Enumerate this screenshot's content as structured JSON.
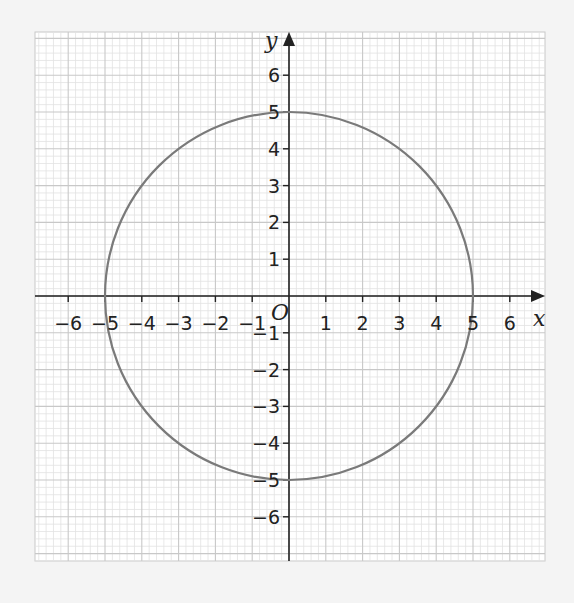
{
  "chart_data": {
    "type": "line",
    "title": "",
    "xlabel": "x",
    "ylabel": "y",
    "origin_label": "O",
    "xlim": [
      -6.9,
      6.95
    ],
    "ylim": [
      -7.2,
      7.2
    ],
    "x_ticks": [
      -6,
      -5,
      -4,
      -3,
      -2,
      -1,
      1,
      2,
      3,
      4,
      5,
      6
    ],
    "y_ticks": [
      -6,
      -5,
      -4,
      -3,
      -2,
      -1,
      1,
      2,
      3,
      4,
      5,
      6
    ],
    "x_tick_labels": [
      "−6",
      "−5",
      "−4",
      "−3",
      "−2",
      "−1",
      "1",
      "2",
      "3",
      "4",
      "5",
      "6"
    ],
    "y_tick_labels": [
      "−6",
      "−5",
      "−4",
      "−3",
      "−2",
      "−1",
      "1",
      "2",
      "3",
      "4",
      "5",
      "6"
    ],
    "grid": {
      "major": 1,
      "minor": 0.2,
      "on": true
    },
    "series": [
      {
        "name": "circle x^2 + y^2 = 25",
        "shape": "circle",
        "center": [
          0,
          0
        ],
        "radius": 5,
        "color": "#7a7a7a"
      }
    ],
    "colors": {
      "background": "#f4f4f4",
      "paper": "#ffffff",
      "minor_grid": "#e2e2e2",
      "major_grid": "#c8c8c8",
      "axis": "#222222",
      "curve": "#7a7a7a"
    },
    "layout": {
      "origin_px": [
        289,
        296
      ],
      "unit_px": 36.8,
      "grid_box": [
        35,
        32,
        545,
        561
      ]
    }
  }
}
